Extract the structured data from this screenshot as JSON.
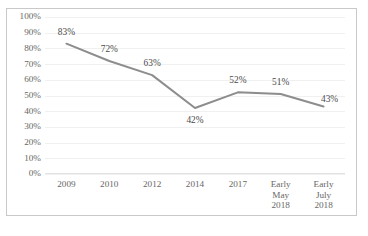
{
  "chart_data": {
    "type": "line",
    "title": "",
    "subtitle": "",
    "xlabel": "",
    "ylabel": "",
    "categories": [
      "2009",
      "2010",
      "2012",
      "2014",
      "2017",
      "Early\nMay\n2018",
      "Early\nJuly\n2018"
    ],
    "values": [
      83,
      72,
      63,
      42,
      52,
      51,
      43
    ],
    "data_labels": [
      "83%",
      "72%",
      "63%",
      "42%",
      "52%",
      "51%",
      "43%"
    ],
    "ylim": [
      0,
      100
    ],
    "ytick_labels": [
      "100%",
      "90%",
      "80%",
      "70%",
      "60%",
      "50%",
      "40%",
      "30%",
      "20%",
      "10%",
      "0%"
    ],
    "ytick_values": [
      100,
      90,
      80,
      70,
      60,
      50,
      40,
      30,
      20,
      10,
      0
    ],
    "grid": true,
    "legend": false,
    "legend_position": "none",
    "series": [
      {
        "name": "",
        "values": [
          83,
          72,
          63,
          42,
          52,
          51,
          43
        ],
        "color": "#8d8d8d"
      }
    ],
    "label_offsets": [
      {
        "dx": 0,
        "dy": -16
      },
      {
        "dx": 0,
        "dy": -16
      },
      {
        "dx": 0,
        "dy": -16
      },
      {
        "dx": 0,
        "dy": 8
      },
      {
        "dx": 0,
        "dy": -16
      },
      {
        "dx": 0,
        "dy": -16
      },
      {
        "dx": 6,
        "dy": -11
      }
    ]
  },
  "colors": {
    "line": "#8d8d8d",
    "border": "#c9c9c9",
    "gridline": "#f0f0f0",
    "axis_text": "#676767",
    "label_text": "#4a4a4a",
    "background": "#ffffff"
  }
}
